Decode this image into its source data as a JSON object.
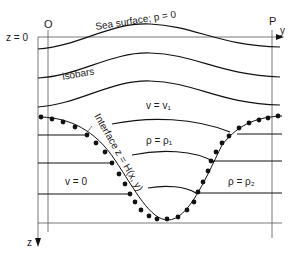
{
  "diagram": {
    "labels": {
      "origin": "O",
      "point_p": "P",
      "axis_y": "y",
      "axis_z": "z",
      "z_zero": "z = 0",
      "sea_surface": "Sea surface; p = 0",
      "isobars": "isobars",
      "upper_velocity": "v = v₁",
      "upper_density": "ρ = ρ₁",
      "lower_velocity": "v = 0",
      "lower_density": "ρ = ρ₂",
      "interface": "Interface z = H(x, y)"
    },
    "colors": {
      "ink": "#111111",
      "axis": "#555555",
      "background": "#ffffff"
    }
  }
}
